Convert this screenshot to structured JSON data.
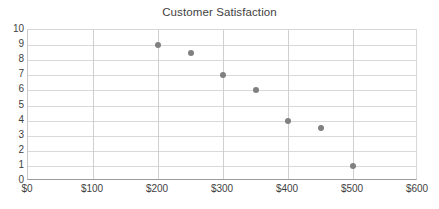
{
  "chart_data": {
    "type": "scatter",
    "title": "Customer Satisfaction",
    "xlabel": "",
    "ylabel": "",
    "xlim": [
      0,
      600
    ],
    "ylim": [
      0,
      10
    ],
    "grid": true,
    "legend": "none",
    "x_tick_labels": [
      "$0",
      "$100",
      "$200",
      "$300",
      "$400",
      "$500",
      "$600"
    ],
    "x_ticks": [
      0,
      100,
      200,
      300,
      400,
      500,
      600
    ],
    "y_tick_labels": [
      "0",
      "1",
      "2",
      "3",
      "4",
      "5",
      "6",
      "7",
      "8",
      "9",
      "10"
    ],
    "y_ticks": [
      0,
      1,
      2,
      3,
      4,
      5,
      6,
      7,
      8,
      9,
      10
    ],
    "marker_color": "#808080",
    "points": [
      {
        "x": 200,
        "y": 9
      },
      {
        "x": 250,
        "y": 8.5
      },
      {
        "x": 300,
        "y": 7
      },
      {
        "x": 350,
        "y": 6
      },
      {
        "x": 400,
        "y": 4
      },
      {
        "x": 450,
        "y": 3.5
      },
      {
        "x": 500,
        "y": 1
      }
    ],
    "series": [
      {
        "name": "Customer Satisfaction",
        "x": [
          200,
          250,
          300,
          350,
          400,
          450,
          500
        ],
        "values": [
          9,
          8.5,
          7,
          6,
          4,
          3.5,
          1
        ]
      }
    ]
  }
}
